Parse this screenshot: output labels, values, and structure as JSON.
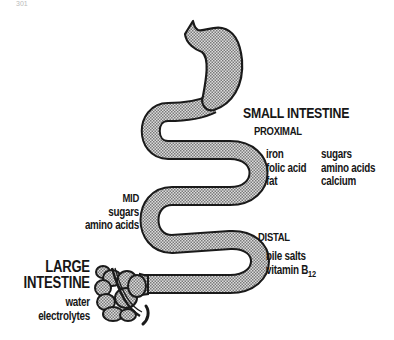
{
  "corner_mark": "301",
  "small_intestine": {
    "title": "SMALL INTESTINE",
    "proximal": {
      "label": "PROXIMAL",
      "col1": [
        "iron",
        "folic acid",
        "fat"
      ],
      "col2": [
        "sugars",
        "amino acids",
        "calcium"
      ]
    },
    "mid": {
      "label": "MID",
      "items": [
        "sugars",
        "amino acids"
      ]
    },
    "distal": {
      "label": "DISTAL",
      "items": [
        "bile salts",
        "vitamin B"
      ],
      "vitamin_subscript": "12"
    }
  },
  "large_intestine": {
    "title_line1": "LARGE",
    "title_line2": "INTESTINE",
    "items": [
      "water",
      "electrolytes"
    ]
  },
  "colors": {
    "outline": "#1a1a1a",
    "fill_dots": "#8a8a8a",
    "fill_bg": "#d8d8d8",
    "text": "#161616"
  }
}
